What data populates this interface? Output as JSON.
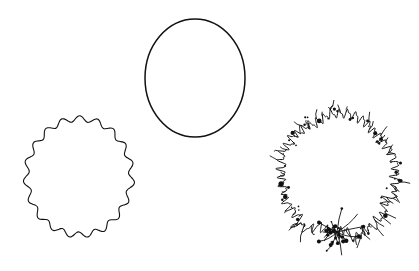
{
  "figure": {
    "title": "Three circular contours of increasing boundary roughness",
    "background_color": "#ffffff",
    "stroke_color": "#111111",
    "width": 419,
    "height": 271,
    "shape_count": 3
  },
  "shapes": [
    {
      "id": "smooth-circle",
      "label": "Smooth circle",
      "position": "top-center",
      "center_x": 195,
      "center_y": 78,
      "radius_x": 50,
      "radius_y": 59,
      "stroke_width": 1.5,
      "roughness": 0,
      "lobes": 0,
      "lobe_amplitude": 0,
      "noise_amplitude": 0,
      "spike_count": 0,
      "blob_count": 0,
      "bbox": {
        "x_min": 145,
        "y_min": 19,
        "x_max": 246,
        "y_max": 138
      }
    },
    {
      "id": "wavy-circle",
      "label": "Wavy / scalloped circle",
      "position": "bottom-left",
      "center_x": 79,
      "center_y": 177,
      "radius_x": 52,
      "radius_y": 58,
      "stroke_width": 1.1,
      "roughness": 1,
      "lobes": 19,
      "lobe_amplitude": 2.9,
      "noise_amplitude": 0.7,
      "spike_count": 0,
      "blob_count": 0,
      "bbox": {
        "x_min": 26,
        "y_min": 118,
        "x_max": 133,
        "y_max": 235
      }
    },
    {
      "id": "fractal-circle",
      "label": "Fractal / highly irregular circle",
      "position": "bottom-right",
      "center_x": 338,
      "center_y": 175,
      "radius_x": 57,
      "radius_y": 60,
      "stroke_width": 1.0,
      "roughness": 2,
      "lobes": 46,
      "lobe_amplitude": 3.4,
      "noise_amplitude": 4.6,
      "spike_count": 64,
      "blob_count": 58,
      "bbox": {
        "x_min": 278,
        "y_min": 110,
        "x_max": 398,
        "y_max": 262
      },
      "burst": {
        "center_x": 337,
        "center_y": 232,
        "ray_count": 11,
        "ray_length": 26
      }
    }
  ]
}
